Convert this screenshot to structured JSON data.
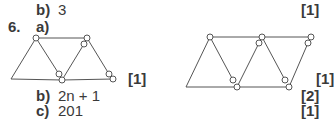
{
  "q5": {
    "part_b_label": "b)",
    "part_b_answer": "3",
    "part_b_mark": "[1]"
  },
  "q6": {
    "number": "6.",
    "part_a_label": "a)",
    "part_a_mark_left": "[1]",
    "part_a_mark_right": "[1]",
    "part_b_label": "b)",
    "part_b_answer": "2n + 1",
    "part_b_mark": "[2]",
    "part_c_label": "c)",
    "part_c_answer": "201",
    "part_c_mark": "[1]"
  },
  "figures": [
    {
      "name": "pattern-3-triangles",
      "description": "Row of 3 triangles formed by matchsticks"
    },
    {
      "name": "pattern-5-triangles",
      "description": "Row of 5 triangles formed by matchsticks"
    }
  ]
}
